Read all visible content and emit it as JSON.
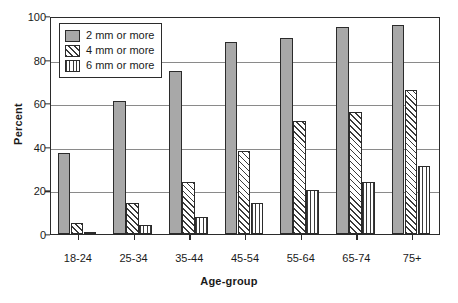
{
  "chart_data": {
    "type": "bar",
    "title": "",
    "xlabel": "Age-group",
    "ylabel": "Percent",
    "ylim": [
      0,
      100
    ],
    "ytick_values": [
      0,
      20,
      40,
      60,
      80,
      100
    ],
    "ytick_labels": [
      "0",
      "20",
      "40",
      "60",
      "80",
      "100"
    ],
    "grid": true,
    "legend_position": "upper left (inside plot area)",
    "categories": [
      "18-24",
      "25-34",
      "35-44",
      "45-54",
      "55-64",
      "65-74",
      "75+"
    ],
    "series": [
      {
        "name": "2 mm or more",
        "pattern": "solid-gray",
        "color": "#a8a8a8",
        "values": [
          37,
          61,
          75,
          88,
          90,
          95,
          96
        ]
      },
      {
        "name": "4 mm or more",
        "pattern": "diagonal-hatch",
        "color": "#ffffff",
        "values": [
          5,
          14,
          24,
          38,
          52,
          56,
          66
        ]
      },
      {
        "name": "6 mm or more",
        "pattern": "vertical-stripes",
        "color": "#ffffff",
        "values": [
          1,
          4,
          8,
          14,
          20,
          24,
          31
        ]
      }
    ]
  },
  "axis_line_color": "#2b2b2b",
  "grid_color": "#8a8a8a"
}
